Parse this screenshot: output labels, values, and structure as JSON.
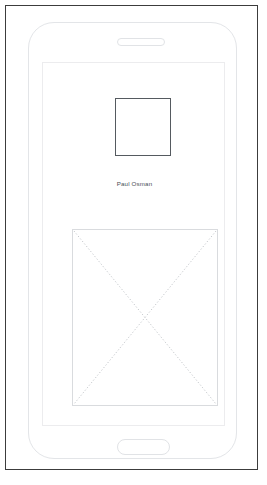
{
  "mockup": {
    "title": "Mobile profile screen wireframe",
    "device": {
      "name": "smartphone-frame",
      "speaker": "earpiece-speaker-slot",
      "home_button": "home-button"
    },
    "screen": {
      "avatar": {
        "name": "avatar-placeholder",
        "shape": "square",
        "border_color": "#555a60",
        "fill_color": "#ffffff"
      },
      "profile_name": "Paul Osman",
      "image_placeholder": {
        "name": "image-placeholder",
        "shape": "rectangle",
        "border_color": "#d9dbde",
        "fill_color": "#ffffff",
        "crossed_out": true,
        "diagonal_style": "dotted",
        "diagonal_color": "#c2c5c9"
      }
    },
    "colors": {
      "page_border": "#3c3c3c",
      "phone_outline": "#e3e5e8",
      "screen_outline": "#ececee",
      "text": "#4a4f55",
      "background": "#ffffff"
    }
  }
}
